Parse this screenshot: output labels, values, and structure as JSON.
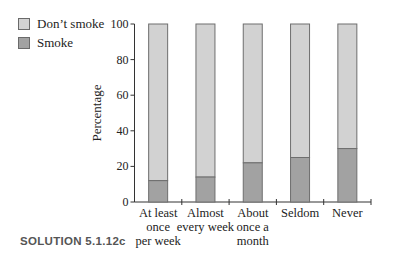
{
  "legend": {
    "items": [
      {
        "label": "Don’t smoke",
        "color": "#d2d2d2"
      },
      {
        "label": "Smoke",
        "color": "#a2a2a2"
      }
    ]
  },
  "caption": "SOLUTION 5.1.12c",
  "colors": {
    "dont_smoke": "#d2d2d2",
    "smoke": "#a2a2a2",
    "bar_outline": "#6e6e6e",
    "axis": "#333333"
  },
  "chart_data": {
    "type": "bar",
    "stacked": true,
    "title": "",
    "xlabel": "",
    "ylabel": "Percentage",
    "ylim": [
      0,
      100
    ],
    "yticks": [
      0,
      20,
      40,
      60,
      80,
      100
    ],
    "grid": false,
    "legend_position": "top-left",
    "categories": [
      [
        "At least",
        "once",
        "per week"
      ],
      [
        "Almost",
        "every week"
      ],
      [
        "About",
        "once a",
        "month"
      ],
      [
        "Seldom"
      ],
      [
        "Never"
      ]
    ],
    "category_names": [
      "At least once per week",
      "Almost every week",
      "About once a month",
      "Seldom",
      "Never"
    ],
    "series": [
      {
        "name": "Smoke",
        "values": [
          12,
          14,
          22,
          25,
          30
        ]
      },
      {
        "name": "Don’t smoke",
        "values": [
          88,
          86,
          78,
          75,
          70
        ]
      }
    ]
  }
}
